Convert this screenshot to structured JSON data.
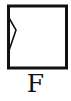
{
  "figure": {
    "label": "F",
    "shape": "square-with-left-notch",
    "notch_side": "left",
    "notch_direction": "inward",
    "stroke_color": "#111111",
    "fill_color": "#ffffff"
  }
}
